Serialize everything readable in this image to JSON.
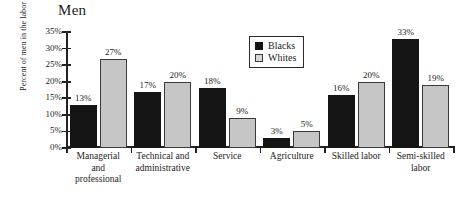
{
  "chart_data": {
    "type": "bar",
    "title": "Men",
    "xlabel": "",
    "ylabel": "Percent of men in the labor force",
    "ylim": [
      0,
      35
    ],
    "ytick_labels": [
      "0%",
      "5%",
      "10%",
      "15%",
      "20%",
      "25%",
      "30%",
      "35%"
    ],
    "ytick_values": [
      0,
      5,
      10,
      15,
      20,
      25,
      30,
      35
    ],
    "grid": false,
    "legend_position": "upper-center-right",
    "categories": [
      "Managerial and professional",
      "Technical and administrative",
      "Service",
      "Agriculture",
      "Skilled labor",
      "Semi-skilled labor"
    ],
    "category_lines": [
      [
        "Managerial",
        "and",
        "professional"
      ],
      [
        "Technical and",
        "administrative"
      ],
      [
        "Service"
      ],
      [
        "Agriculture"
      ],
      [
        "Skilled labor"
      ],
      [
        "Semi-skilled",
        "labor"
      ]
    ],
    "series": [
      {
        "name": "Blacks",
        "color": "#141414",
        "values": [
          13,
          17,
          18,
          3,
          16,
          33
        ],
        "data_labels": [
          "13%",
          "17%",
          "18%",
          "3%",
          "16%",
          "33%"
        ]
      },
      {
        "name": "Whites",
        "color": "#c6c6c6",
        "values": [
          27,
          20,
          9,
          5,
          20,
          19
        ],
        "data_labels": [
          "27%",
          "20%",
          "9%",
          "5%",
          "20%",
          "19%"
        ]
      }
    ]
  }
}
